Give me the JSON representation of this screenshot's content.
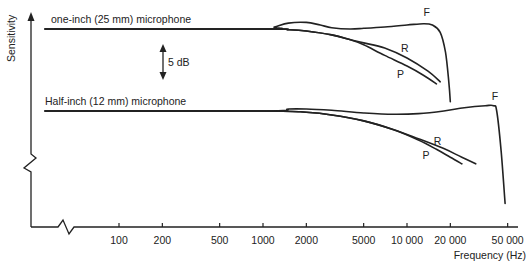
{
  "chart_data": {
    "type": "line",
    "title": "",
    "xlabel": "Frequency (Hz)",
    "ylabel": "Sensitivity",
    "x_scale": "log",
    "x_ticks": [
      100,
      200,
      500,
      1000,
      2000,
      5000,
      10000,
      20000,
      50000
    ],
    "x_tick_labels": [
      "100",
      "200",
      "500",
      "1000",
      "2000",
      "5000",
      "10 000",
      "20 000",
      "50 000"
    ],
    "y_units": "dB (relative)",
    "scale_marker": {
      "label": "5 dB",
      "value_db": 5
    },
    "axis_breaks": [
      "x",
      "y"
    ],
    "grid": false,
    "groups": [
      {
        "name": "one-inch (25 mm) microphone",
        "series": [
          {
            "name": "F",
            "x": [
              20,
              1000,
              1200,
              1500,
              2000,
              2500,
              3000,
              4000,
              5000,
              7000,
              10000,
              13000,
              15000,
              17000,
              18500,
              19500,
              20000
            ],
            "y": [
              0,
              0,
              0.3,
              0.9,
              1.0,
              0.6,
              0.2,
              0.0,
              0.1,
              0.3,
              0.6,
              0.8,
              0.6,
              -0.5,
              -3.5,
              -8,
              -11
            ]
          },
          {
            "name": "R",
            "x": [
              20,
              1000,
              1500,
              2000,
              3000,
              4000,
              5000,
              7000,
              10000,
              14000,
              17000
            ],
            "y": [
              0,
              0,
              -0.1,
              -0.3,
              -0.9,
              -1.6,
              -2.1,
              -2.9,
              -4.4,
              -6.4,
              -8.0
            ]
          },
          {
            "name": "P",
            "x": [
              20,
              1000,
              1500,
              2000,
              3000,
              4000,
              5000,
              7000,
              10000,
              13000,
              16000
            ],
            "y": [
              0,
              0,
              -0.1,
              -0.3,
              -0.9,
              -1.6,
              -2.4,
              -4.0,
              -5.6,
              -7.0,
              -8.3
            ]
          }
        ]
      },
      {
        "name": "Half-inch (12 mm) microphone",
        "series": [
          {
            "name": "F",
            "x": [
              20,
              1000,
              1500,
              2000,
              3000,
              5000,
              8000,
              12000,
              18000,
              25000,
              35000,
              40000,
              42000,
              45000,
              48000
            ],
            "y": [
              0,
              0,
              0.3,
              0.3,
              0.1,
              -0.3,
              -0.5,
              -0.4,
              0.0,
              0.5,
              0.8,
              0.8,
              0,
              -6,
              -14
            ]
          },
          {
            "name": "R",
            "x": [
              20,
              1000,
              2000,
              3000,
              5000,
              8000,
              12000,
              18000,
              24000,
              30000
            ],
            "y": [
              0,
              0,
              -0.2,
              -0.6,
              -1.5,
              -2.8,
              -4.2,
              -5.7,
              -7.0,
              -8.0
            ]
          },
          {
            "name": "P",
            "x": [
              20,
              1000,
              2000,
              3000,
              5000,
              8000,
              12000,
              16000,
              20000,
              24000
            ],
            "y": [
              0,
              0,
              -0.2,
              -0.6,
              -1.5,
              -2.8,
              -4.4,
              -5.8,
              -7.0,
              -8.0
            ]
          }
        ]
      }
    ]
  }
}
